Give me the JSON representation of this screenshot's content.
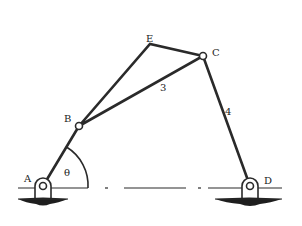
{
  "diagram": {
    "type": "four-bar linkage (kinematic mechanism)",
    "points": {
      "A": {
        "label": "A",
        "x": 43,
        "y": 186
      },
      "B": {
        "label": "B",
        "x": 79,
        "y": 126
      },
      "C": {
        "label": "C",
        "x": 203,
        "y": 56
      },
      "D": {
        "label": "D",
        "x": 250,
        "y": 186
      },
      "E": {
        "label": "E",
        "x": 150,
        "y": 44
      }
    },
    "links": {
      "crank": {
        "from": "A",
        "to": "B"
      },
      "coupler": {
        "label": "3",
        "vertices": [
          "B",
          "E",
          "C"
        ]
      },
      "rocker": {
        "label": "4",
        "from": "C",
        "to": "D"
      }
    },
    "angle": {
      "label": "θ",
      "at": "A",
      "between": [
        "AB",
        "AD"
      ]
    },
    "labels": {
      "A": "A",
      "B": "B",
      "C": "C",
      "D": "D",
      "E": "E",
      "link3": "3",
      "link4": "4",
      "theta": "θ"
    },
    "colors": {
      "line": "#2a2a2a",
      "background": "#ffffff",
      "ground": "#1e1e1e"
    }
  }
}
